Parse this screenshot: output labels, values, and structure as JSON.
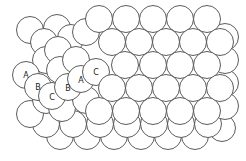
{
  "diagram": {
    "type": "close-packed sphere stacking",
    "stroke_color": "#4a4a4a",
    "fill_color": "#ffffff",
    "sphere_radius": 13.5,
    "labels": [
      {
        "text": "A",
        "x": 26,
        "y": 75
      },
      {
        "text": "B",
        "x": 38,
        "y": 87
      },
      {
        "text": "C",
        "x": 52,
        "y": 97
      },
      {
        "text": "B",
        "x": 68,
        "y": 88
      },
      {
        "text": "A",
        "x": 81,
        "y": 80
      },
      {
        "text": "C",
        "x": 96,
        "y": 72
      }
    ],
    "label_text": {
      "l0": "A",
      "l1": "B",
      "l2": "C",
      "l3": "B",
      "l4": "A",
      "l5": "C"
    }
  }
}
